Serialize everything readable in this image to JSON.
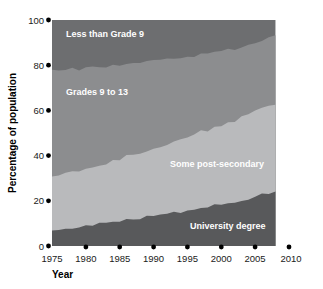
{
  "chart_data": {
    "type": "area",
    "title": "",
    "subtitle": "",
    "xlabel": "Year",
    "ylabel": "Percentage of population",
    "xlim": [
      1975,
      2010
    ],
    "ylim": [
      0,
      100
    ],
    "xticks": [
      1975,
      1980,
      1985,
      1990,
      1995,
      2000,
      2005,
      2010
    ],
    "yticks": [
      0,
      20,
      40,
      60,
      80,
      100
    ],
    "grid": false,
    "legend_position": "inline-labels",
    "stacked": true,
    "stack_order": "bottom-to-top",
    "data_extent_years": [
      1975,
      2008
    ],
    "x": [
      1975,
      1976,
      1977,
      1978,
      1979,
      1980,
      1981,
      1982,
      1983,
      1984,
      1985,
      1986,
      1987,
      1988,
      1989,
      1990,
      1991,
      1992,
      1993,
      1994,
      1995,
      1996,
      1997,
      1998,
      1999,
      2000,
      2001,
      2002,
      2003,
      2004,
      2005,
      2006,
      2007,
      2008
    ],
    "series": [
      {
        "name": "University degree",
        "color": "#58595b",
        "values": [
          7,
          7,
          8,
          8,
          8,
          9,
          9,
          10,
          10,
          11,
          11,
          12,
          12,
          12,
          13,
          13,
          14,
          14,
          15,
          15,
          16,
          16,
          17,
          17,
          18,
          18,
          19,
          19,
          20,
          21,
          22,
          23,
          23,
          24
        ]
      },
      {
        "name": "Some post-secondary",
        "color": "#b9babc",
        "values": [
          24,
          24,
          24,
          25,
          25,
          25,
          26,
          26,
          26,
          27,
          27,
          28,
          28,
          29,
          29,
          30,
          30,
          31,
          31,
          32,
          32,
          33,
          34,
          34,
          35,
          35,
          36,
          36,
          37,
          37,
          38,
          38,
          39,
          39
        ]
      },
      {
        "name": "Grades 9 to 13",
        "color": "#8c8d8f",
        "values": [
          47,
          47,
          46,
          46,
          45,
          45,
          44,
          43,
          43,
          42,
          42,
          41,
          41,
          40,
          40,
          39,
          38,
          38,
          37,
          36,
          36,
          35,
          34,
          34,
          33,
          33,
          32,
          32,
          31,
          31,
          30,
          30,
          30,
          30
        ]
      },
      {
        "name": "Less than Grade 9",
        "color": "#6d6e70",
        "values": [
          22,
          22,
          22,
          21,
          22,
          21,
          21,
          21,
          21,
          20,
          20,
          19,
          19,
          19,
          18,
          18,
          18,
          17,
          17,
          17,
          16,
          16,
          15,
          15,
          14,
          14,
          13,
          13,
          12,
          11,
          10,
          9,
          8,
          7
        ]
      }
    ],
    "cumulative_upper_bounds": {
      "university_degree": [
        7,
        7,
        8,
        8,
        8,
        9,
        9,
        10,
        10,
        11,
        11,
        12,
        12,
        12,
        13,
        13,
        14,
        14,
        15,
        15,
        16,
        16,
        17,
        17,
        18,
        18,
        19,
        19,
        20,
        21,
        22,
        23,
        23,
        24
      ],
      "some_post_secondary": [
        31,
        31,
        32,
        33,
        33,
        34,
        35,
        36,
        36,
        38,
        38,
        40,
        40,
        41,
        42,
        43,
        44,
        45,
        46,
        47,
        48,
        49,
        51,
        51,
        53,
        53,
        55,
        55,
        57,
        58,
        60,
        61,
        62,
        63
      ],
      "grades_9_to_13": [
        78,
        78,
        78,
        79,
        78,
        79,
        79,
        79,
        79,
        80,
        80,
        81,
        81,
        81,
        82,
        82,
        82,
        83,
        83,
        83,
        84,
        84,
        85,
        85,
        86,
        86,
        87,
        87,
        88,
        89,
        90,
        91,
        92,
        93
      ],
      "less_than_grade_9": [
        100,
        100,
        100,
        100,
        100,
        100,
        100,
        100,
        100,
        100,
        100,
        100,
        100,
        100,
        100,
        100,
        100,
        100,
        100,
        100,
        100,
        100,
        100,
        100,
        100,
        100,
        100,
        100,
        100,
        100,
        100,
        100,
        100,
        100
      ]
    },
    "annotations": [
      {
        "text": "Less than Grade 9",
        "x_year": 1977.5,
        "y_pct": 92,
        "anchor": "start"
      },
      {
        "text": "Grades 9 to 13",
        "x_year": 1977.5,
        "y_pct": 68,
        "anchor": "start"
      },
      {
        "text": "Some post-secondary",
        "x_year": 1998.5,
        "y_pct": 37,
        "anchor": "start"
      },
      {
        "text": "University degree",
        "x_year": 1999.5,
        "y_pct": 8,
        "anchor": "start"
      }
    ]
  },
  "axes": {
    "y_title": "Percentage of population",
    "x_title": "Year",
    "y_tick_labels": [
      "0",
      "20",
      "40",
      "60",
      "80",
      "100"
    ],
    "x_tick_labels": [
      "1975",
      "1980",
      "1985",
      "1990",
      "1995",
      "2000",
      "2005",
      "2010"
    ]
  },
  "labels": {
    "band_top": "Less than Grade 9",
    "band_upper_mid": "Grades 9 to 13",
    "band_lower_mid": "Some post-secondary",
    "band_bottom": "University degree"
  },
  "colors": {
    "background": "#ffffff",
    "less_than_grade_9": "#6d6e70",
    "grades_9_to_13": "#8c8d8f",
    "some_post_secondary": "#b9babc",
    "university_degree": "#58595b",
    "tick_dot": "#000000",
    "text": "#1a1a1a"
  }
}
